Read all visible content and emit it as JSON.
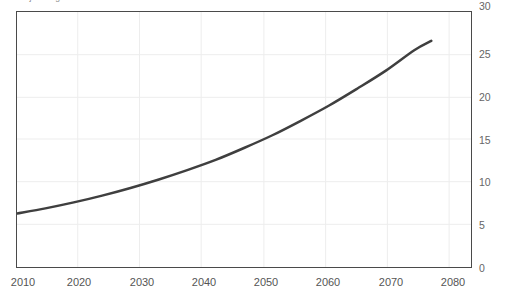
{
  "chart_data": {
    "type": "line",
    "title": "",
    "subtitle": "",
    "xlabel": "",
    "ylabel": "",
    "xlim": [
      2010,
      2090
    ],
    "ylim": [
      0,
      30
    ],
    "grid": true,
    "legend": "none",
    "x_ticks": [
      "2010",
      "2020",
      "2030",
      "2040",
      "2050",
      "2060",
      "2070",
      "2080"
    ],
    "y_ticks": [
      "0",
      "5",
      "10",
      "15",
      "20",
      "25",
      "30"
    ],
    "y_top_label_clipped": "30",
    "line_color": "#3f3f3f",
    "line_width": 2.5,
    "series": [
      {
        "name": "series-1",
        "x": [
          2010,
          2015,
          2020,
          2025,
          2030,
          2035,
          2040,
          2045,
          2050,
          2055,
          2060,
          2065,
          2070,
          2075,
          2080,
          2083
        ],
        "values": [
          6.3,
          6.9,
          7.6,
          8.4,
          9.3,
          10.3,
          11.4,
          12.6,
          14.0,
          15.5,
          17.2,
          19.0,
          21.0,
          23.1,
          25.5,
          26.6
        ]
      }
    ]
  },
  "axis": {
    "y": {
      "ticks": [
        {
          "label": "0",
          "value": 0
        },
        {
          "label": "5",
          "value": 5
        },
        {
          "label": "10",
          "value": 10
        },
        {
          "label": "15",
          "value": 15
        },
        {
          "label": "20",
          "value": 20
        },
        {
          "label": "25",
          "value": 25
        },
        {
          "label": "30",
          "value": 30
        }
      ]
    },
    "x": {
      "ticks": [
        {
          "label": "2010",
          "value": 2010
        },
        {
          "label": "2020",
          "value": 2020
        },
        {
          "label": "2030",
          "value": 2030
        },
        {
          "label": "2040",
          "value": 2040
        },
        {
          "label": "2050",
          "value": 2050
        },
        {
          "label": "2060",
          "value": 2060
        },
        {
          "label": "2070",
          "value": 2070
        },
        {
          "label": "2080",
          "value": 2080
        }
      ]
    }
  },
  "header": {
    "clipped_title": "Projected growth"
  }
}
